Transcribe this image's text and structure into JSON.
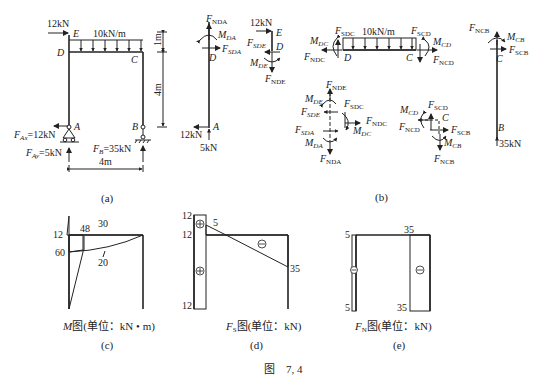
{
  "figure": {
    "caption": "图    7, 4",
    "panels": [
      {
        "id": "a",
        "label": "(a)",
        "title": "Frame structure with loads and reactions",
        "nodes": [
          "A",
          "B",
          "C",
          "D",
          "E"
        ],
        "loads": {
          "horizontal_force": "12kN",
          "distributed_load": "10kN/m"
        },
        "reactions": {
          "FAx": "=12kN",
          "FAy": "=5kN",
          "FB": "=35kN"
        },
        "dimensions": {
          "top_segment": "1m",
          "column_height": "4m",
          "span": "4m"
        }
      },
      {
        "id": "b",
        "label": "(b)",
        "title": "Free body diagrams",
        "member_DA": {
          "labels": [
            "FNDA",
            "MDA",
            "FSDA",
            "D",
            "A"
          ],
          "bottom_forces": [
            "12kN",
            "5kN"
          ]
        },
        "member_DE": {
          "labels": [
            "12kN",
            "E",
            "FSDE",
            "D",
            "MDE",
            "FNDE"
          ]
        },
        "member_DC": {
          "labels": [
            "MDC",
            "FSDC",
            "10kN/m",
            "FSCD",
            "MCD",
            "FNDC",
            "D",
            "C",
            "FNCD"
          ]
        },
        "member_CB": {
          "labels": [
            "FNCB",
            "MCB",
            "FSCB",
            "C",
            "B"
          ],
          "bottom_force": "35kN"
        },
        "joint_D": [
          "FNDE",
          "MDE",
          "FSDE",
          "FSDC",
          "FNDC",
          "FSDA",
          "MDC",
          "MDA",
          "FNDA"
        ],
        "joint_C": [
          "MCD",
          "FSCD",
          "C",
          "FNCD",
          "FSCB",
          "MCB",
          "FNCB"
        ]
      },
      {
        "id": "c",
        "label": "(c)",
        "title": "M图(单位：kN • m)",
        "values": [
          "12",
          "48",
          "30",
          "60",
          "20"
        ]
      },
      {
        "id": "d",
        "label": "(d)",
        "title": "FS图(单位：kN)",
        "values": [
          "12",
          "12",
          "5",
          "35",
          "12"
        ],
        "signs": [
          "⊕",
          "⊕",
          "⊖"
        ]
      },
      {
        "id": "e",
        "label": "(e)",
        "title": "FN图(单位：kN)",
        "values": [
          "5",
          "5",
          "35",
          "35"
        ],
        "signs": [
          "⊖",
          "⊖"
        ]
      }
    ]
  },
  "text": {
    "a_12kN": "12kN",
    "a_q": "10kN/m",
    "a_E": "E",
    "a_D": "D",
    "a_C": "C",
    "a_A": "A",
    "a_B": "B",
    "a_1m": "1m",
    "a_4m_v": "4m",
    "a_4m_h": "4m",
    "a_FAx_F": "F",
    "a_FAx_sub": "Ax",
    "a_FAx_val": "=12kN",
    "a_FAy_F": "F",
    "a_FAy_sub": "Ay",
    "a_FAy_val": "=5kN",
    "a_FB_F": "F",
    "a_FB_sub": "B",
    "a_FB_val": "=35kN",
    "a_label": "(a)",
    "b_label": "(b)",
    "c_label": "(c)",
    "d_label": "(d)",
    "e_label": "(e)",
    "F": "F",
    "M": "M",
    "NDA": "NDA",
    "DA": "DA",
    "SDA": "SDA",
    "SDE": "SDE",
    "DE": "DE",
    "NDE": "NDE",
    "DC": "DC",
    "SDC": "SDC",
    "NDC": "NDC",
    "SCD": "SCD",
    "CD": "CD",
    "NCD": "NCD",
    "NCB": "NCB",
    "CB": "CB",
    "SCB": "SCB",
    "b_12kN_top": "12kN",
    "b_12kN_bot": "12kN",
    "b_5kN": "5kN",
    "b_35kN": "35kN",
    "b_q": "10kN/m",
    "D": "D",
    "E": "E",
    "C": "C",
    "A": "A",
    "B": "B",
    "c_12": "12",
    "c_48": "48",
    "c_30": "30",
    "c_60": "60",
    "c_20": "20",
    "c_title_M": "M",
    "c_title_rest": "图(单位：kN • m)",
    "d_12a": "12",
    "d_12b": "12",
    "d_12c": "12",
    "d_5": "5",
    "d_35": "35",
    "d_title_F": "F",
    "d_title_sub": "S",
    "d_title_rest": "图(单位：kN)",
    "e_5a": "5",
    "e_5b": "5",
    "e_35a": "35",
    "e_35b": "35",
    "e_title_F": "F",
    "e_title_sub": "N",
    "e_title_rest": "图(单位：kN)",
    "plus": "+",
    "minus": "−",
    "caption": "图    7, 4"
  }
}
